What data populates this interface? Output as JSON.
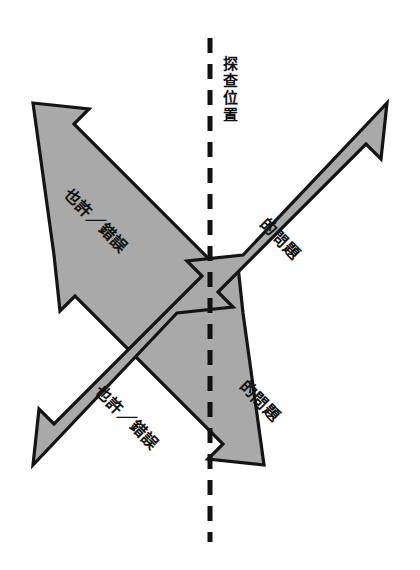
{
  "figure": {
    "type": "cross-arrow-diagram",
    "background_color": "#ffffff",
    "arrow_fill_color": "#a9a9a9",
    "arrow_outline_color": "#141414",
    "divider_color": "#111111"
  },
  "divider": {
    "label": "探查位置",
    "style": "dashed-vertical"
  },
  "arrows": {
    "descending": {
      "name": "maybe-error-axis",
      "upper_left_label": "也許／錯誤",
      "lower_right_label": "也許／錯誤"
    },
    "ascending": {
      "name": "question-axis",
      "upper_right_label": "的問題",
      "lower_left_label": "的問題"
    }
  },
  "labels": {
    "maybe_error_top": "也許／錯誤",
    "maybe_error_bottom": "也許／錯誤",
    "question_top": "的問題",
    "question_bottom": "的問題",
    "probe_position": "探查位置"
  }
}
